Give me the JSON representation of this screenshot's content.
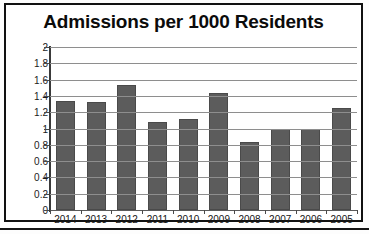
{
  "chart_data": {
    "type": "bar",
    "title": "Admissions per 1000 Residents",
    "xlabel": "",
    "ylabel": "",
    "categories": [
      "2014",
      "2013",
      "2012",
      "2011",
      "2010",
      "2009",
      "2008",
      "2007",
      "2006",
      "2005"
    ],
    "values": [
      1.34,
      1.33,
      1.54,
      1.08,
      1.12,
      1.44,
      0.84,
      0.99,
      1.0,
      1.25
    ],
    "ylim": [
      0,
      2
    ],
    "ytick_labels": [
      "2",
      "1.8",
      "1.6",
      "1.4",
      "1.2",
      "1",
      "0.8",
      "0.6",
      "0.4",
      "0.2",
      "0"
    ],
    "ytick_values": [
      2,
      1.8,
      1.6,
      1.4,
      1.2,
      1,
      0.8,
      0.6,
      0.4,
      0.2,
      0
    ],
    "grid": true,
    "legend": false,
    "legend_position": "none",
    "bar_color": "#5c5c5c",
    "gridline_color": "#8e8e8e",
    "axis_color": "#3a3a3a",
    "text_color": "#111111"
  }
}
